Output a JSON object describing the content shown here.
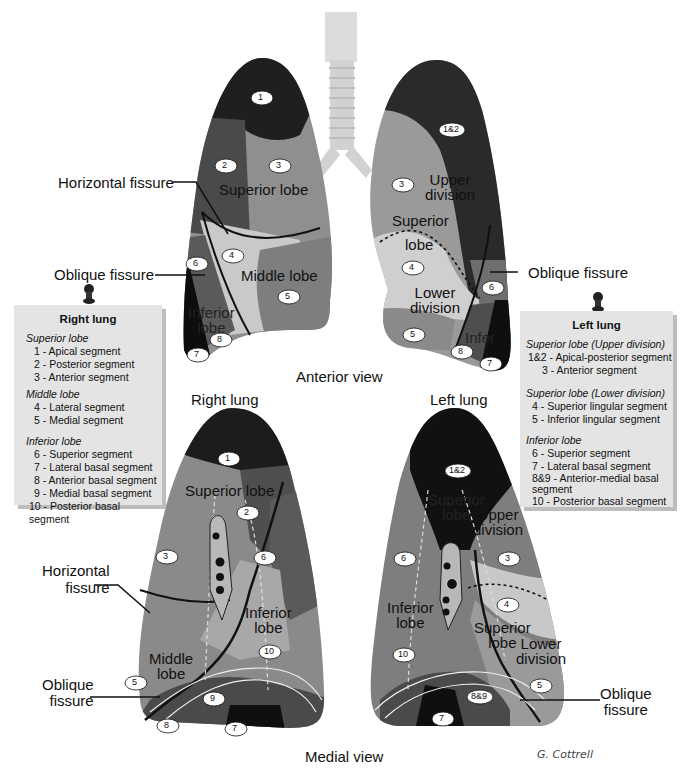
{
  "figure": {
    "views": {
      "anterior": "Anterior view",
      "medial": "Medial view"
    },
    "lung_titles": {
      "right": "Right lung",
      "left": "Left lung"
    },
    "signature": "G. Cottrell",
    "colors": {
      "darkest": "#1a1a1a",
      "dark": "#3d3d3d",
      "mid_dark": "#5c5c5c",
      "mid": "#8a8a8a",
      "light": "#a8a8a8",
      "lighter": "#c8c8c8",
      "trachea": "#d8d8d8",
      "note_bg": "#e4e4e4"
    }
  },
  "anterior_view": {
    "right_lung": {
      "callouts": {
        "horizontal_fissure": "Horizontal fissure",
        "oblique_fissure": "Oblique fissure"
      },
      "lobes": {
        "superior": "Superior lobe",
        "middle": "Middle lobe",
        "inferior_line1": "Inferior",
        "inferior_line2": "lobe"
      },
      "segments": [
        "1",
        "2",
        "3",
        "4",
        "5",
        "6",
        "7",
        "8"
      ]
    },
    "left_lung": {
      "callouts": {
        "oblique_fissure": "Oblique fissure"
      },
      "lobes": {
        "upper_division_line1": "Upper",
        "upper_division_line2": "division",
        "superior_line1": "Superior",
        "superior_line2": "lobe",
        "lower_division_line1": "Lower",
        "lower_division_line2": "division",
        "inferior_partial": "Infer"
      },
      "segments": [
        "1&2",
        "3",
        "4",
        "5",
        "6",
        "7",
        "8"
      ]
    }
  },
  "medial_view": {
    "right_lung": {
      "callouts": {
        "horizontal_fissure_line1": "Horizontal",
        "horizontal_fissure_line2": "fissure",
        "oblique_fissure_line1": "Oblique",
        "oblique_fissure_line2": "fissure"
      },
      "lobes": {
        "superior": "Superior lobe",
        "middle_line1": "Middle",
        "middle_line2": "lobe",
        "inferior_line1": "Inferior",
        "inferior_line2": "lobe"
      },
      "segments": [
        "1",
        "2",
        "3",
        "6",
        "10",
        "5",
        "9",
        "8",
        "7"
      ]
    },
    "left_lung": {
      "callouts": {
        "oblique_fissure_line1": "Oblique",
        "oblique_fissure_line2": "fissure"
      },
      "lobes": {
        "superior_line1": "Superior",
        "superior_line2": "lobe",
        "upper_division_line1": "Upper",
        "upper_division_line2": "division",
        "inferior_line1": "Inferior",
        "inferior_line2": "lobe",
        "superior2_line1": "Superior",
        "superior2_line2": "lobe",
        "lower_division_line1": "Lower",
        "lower_division_line2": "division"
      },
      "segments": [
        "1&2",
        "6",
        "3",
        "4",
        "10",
        "8&9",
        "5",
        "7"
      ]
    }
  },
  "legends": {
    "right": {
      "title": "Right lung",
      "groups": [
        {
          "name": "Superior lobe",
          "items": [
            "1 - Apical segment",
            "2 - Posterior segment",
            "3 - Anterior segment"
          ]
        },
        {
          "name": "Middle lobe",
          "items": [
            "4 - Lateral segment",
            "5 - Medial segment"
          ]
        },
        {
          "name": "Inferior lobe",
          "items": [
            "6 - Superior segment",
            "7 - Lateral basal segment",
            "8 - Anterior basal segment",
            "9 - Medial basal segment",
            "10 - Posterior basal segment"
          ]
        }
      ]
    },
    "left": {
      "title": "Left lung",
      "groups": [
        {
          "name": "Superior lobe (Upper division)",
          "items": [
            "1&2  - Apical-posterior segment",
            "3 - Anterior segment"
          ]
        },
        {
          "name": "Superior lobe (Lower division)",
          "items": [
            "4  - Superior lingular segment",
            "5  - Inferior lingular segment"
          ]
        },
        {
          "name": "Inferior lobe",
          "items": [
            "6  - Superior segment",
            "7  - Lateral basal segment",
            "8&9 - Anterior-medial basal segment",
            "10  - Posterior basal segment"
          ]
        }
      ]
    }
  }
}
